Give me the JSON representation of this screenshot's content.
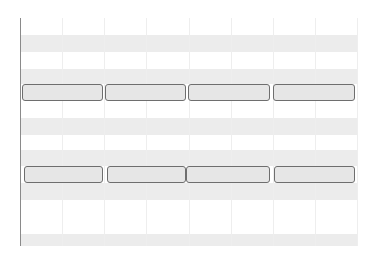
{
  "timeline": {
    "colors": {
      "band_gray": "#ececec",
      "band_white": "#ffffff",
      "grid_line": "#eeeeee",
      "axis_line": "#8a8a8a",
      "segment_fill": "#e6e6e6",
      "segment_border": "#6e6e6e"
    },
    "columns": 8,
    "rows": [
      {
        "type": "white",
        "top": 0,
        "height": 17
      },
      {
        "type": "gray",
        "top": 17,
        "height": 17
      },
      {
        "type": "white",
        "top": 34,
        "height": 17
      },
      {
        "type": "gray",
        "top": 51,
        "height": 15
      },
      {
        "type": "bars",
        "top": 66,
        "height": 17,
        "segments": [
          {
            "left": 2,
            "width": 81
          },
          {
            "left": 85,
            "width": 81
          },
          {
            "left": 168,
            "width": 82
          },
          {
            "left": 253,
            "width": 82
          }
        ]
      },
      {
        "type": "white",
        "top": 83,
        "height": 17
      },
      {
        "type": "gray",
        "top": 100,
        "height": 17
      },
      {
        "type": "white",
        "top": 117,
        "height": 15
      },
      {
        "type": "gray",
        "top": 132,
        "height": 16
      },
      {
        "type": "bars",
        "top": 148,
        "height": 17,
        "segments": [
          {
            "left": 4,
            "width": 79
          },
          {
            "left": 87,
            "width": 79
          },
          {
            "left": 166,
            "width": 84
          },
          {
            "left": 254,
            "width": 81
          }
        ]
      },
      {
        "type": "gray",
        "top": 165,
        "height": 17
      },
      {
        "type": "white",
        "top": 182,
        "height": 17
      },
      {
        "type": "white",
        "top": 199,
        "height": 17
      },
      {
        "type": "gray",
        "top": 216,
        "height": 12
      }
    ]
  }
}
